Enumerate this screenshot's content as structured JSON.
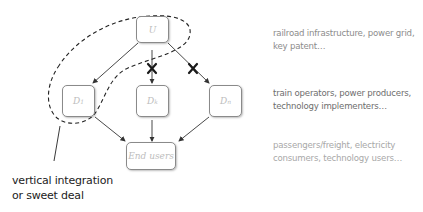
{
  "diagram": {
    "nodes": {
      "upstream": {
        "label": "U"
      },
      "d1": {
        "label": "D",
        "sub": "1"
      },
      "d2": {
        "label": "D",
        "sub": "k"
      },
      "dn": {
        "label": "D",
        "sub": "n"
      },
      "end_users": {
        "label": "End users"
      }
    },
    "annotation": {
      "line1": "vertical integration",
      "line2": "or sweet deal"
    },
    "descriptions": {
      "upstream": {
        "line1": "railroad infrastructure, power grid,",
        "line2": "key patent…",
        "color": "#8c8c8c"
      },
      "downstream": {
        "line1": "train operators, power producers,",
        "line2": "technology implementers…",
        "color": "#6e6e6e"
      },
      "end_users": {
        "line1": "passengers/freight, electricity",
        "line2": "consumers, technology users…",
        "color": "#a8a8a8"
      }
    },
    "blocked_edges": [
      "U→Dk",
      "U→Dn"
    ],
    "colors": {
      "node_border": "#8a8a8a",
      "arrow": "#333333",
      "dash": "#222222",
      "cross": "#1a1a1a"
    }
  }
}
